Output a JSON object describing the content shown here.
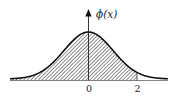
{
  "figure": {
    "type": "normal-distribution-curve",
    "y_axis_label": "ϕ(x)",
    "x_tick_labels": [
      "0",
      "2"
    ],
    "shaded_region": {
      "from": "-∞",
      "to": "2"
    },
    "colors": {
      "ink": "#222222",
      "background": "#ffffff"
    }
  }
}
